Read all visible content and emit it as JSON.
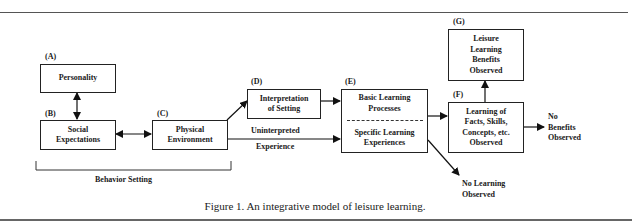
{
  "figure": {
    "caption": "Figure 1.  An integrative model of leisure learning.",
    "bracket_label": "Behavior Setting"
  },
  "nodes": {
    "A": {
      "tag": "(A)",
      "lines": [
        "Personality"
      ]
    },
    "B": {
      "tag": "(B)",
      "lines": [
        "Social",
        "Expectations"
      ]
    },
    "C": {
      "tag": "(C)",
      "lines": [
        "Physical",
        "Environment"
      ]
    },
    "D": {
      "tag": "(D)",
      "lines": [
        "Interpretation",
        "of Setting"
      ]
    },
    "E": {
      "tag": "(E)",
      "top_lines": [
        "Basic Learning",
        "Processes"
      ],
      "bottom_lines": [
        "Specific Learning",
        "Experiences"
      ]
    },
    "F": {
      "tag": "(F)",
      "lines": [
        "Learning of",
        "Facts, Skills,",
        "Concepts, etc.",
        "Observed"
      ]
    },
    "G": {
      "tag": "(G)",
      "lines": [
        "Leisure",
        "Learning",
        "Benefits",
        "Observed"
      ]
    }
  },
  "outcomes": {
    "no_benefits": [
      "No",
      "Benefits",
      "Observed"
    ],
    "no_learning": [
      "No Learning",
      "Observed"
    ]
  },
  "edge_labels": {
    "uninterpreted_top": "Uninterpreted",
    "uninterpreted_bottom": "Experience"
  },
  "edges": [
    {
      "from": "A",
      "to": "B",
      "type": "bidirectional"
    },
    {
      "from": "B",
      "to": "C",
      "type": "bidirectional"
    },
    {
      "from": "C",
      "to": "D",
      "type": "directed"
    },
    {
      "from": "C",
      "to": "E",
      "type": "directed",
      "label": "Uninterpreted Experience"
    },
    {
      "from": "D",
      "to": "E",
      "type": "directed"
    },
    {
      "from": "E",
      "to": "F",
      "type": "directed"
    },
    {
      "from": "E",
      "to": "No Learning Observed",
      "type": "directed"
    },
    {
      "from": "F",
      "to": "G",
      "type": "directed"
    },
    {
      "from": "F",
      "to": "No Benefits Observed",
      "type": "directed"
    }
  ]
}
